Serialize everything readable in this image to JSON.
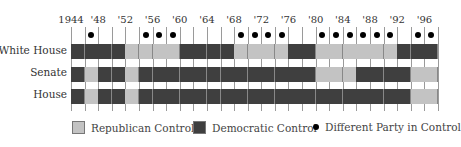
{
  "chart_data": {
    "type": "heatmap",
    "title": "",
    "x_start": 1944,
    "interval_years": 2,
    "years": [
      1944,
      1946,
      1948,
      1950,
      1952,
      1954,
      1956,
      1958,
      1960,
      1962,
      1964,
      1966,
      1968,
      1970,
      1972,
      1974,
      1976,
      1978,
      1980,
      1982,
      1984,
      1986,
      1988,
      1990,
      1992,
      1994,
      1996
    ],
    "tick_labels": [
      {
        "year": 1944,
        "label": "1944"
      },
      {
        "year": 1948,
        "label": "'48"
      },
      {
        "year": 1952,
        "label": "'52"
      },
      {
        "year": 1956,
        "label": "'56"
      },
      {
        "year": 1960,
        "label": "'60"
      },
      {
        "year": 1964,
        "label": "'64"
      },
      {
        "year": 1968,
        "label": "'68"
      },
      {
        "year": 1972,
        "label": "'72"
      },
      {
        "year": 1976,
        "label": "'76"
      },
      {
        "year": 1980,
        "label": "'80"
      },
      {
        "year": 1984,
        "label": "'84"
      },
      {
        "year": 1988,
        "label": "'88"
      },
      {
        "year": 1992,
        "label": "'92"
      },
      {
        "year": 1996,
        "label": "'96"
      }
    ],
    "series": [
      {
        "name": "White House",
        "values": [
          "D",
          "D",
          "D",
          "D",
          "R",
          "R",
          "R",
          "R",
          "D",
          "D",
          "D",
          "D",
          "R",
          "R",
          "R",
          "R",
          "D",
          "D",
          "R",
          "R",
          "R",
          "R",
          "R",
          "R",
          "D",
          "D",
          "D"
        ]
      },
      {
        "name": "Senate",
        "values": [
          "D",
          "R",
          "D",
          "D",
          "R",
          "D",
          "D",
          "D",
          "D",
          "D",
          "D",
          "D",
          "D",
          "D",
          "D",
          "D",
          "D",
          "D",
          "R",
          "R",
          "R",
          "D",
          "D",
          "D",
          "D",
          "R",
          "R"
        ]
      },
      {
        "name": "House",
        "values": [
          "D",
          "R",
          "D",
          "D",
          "R",
          "D",
          "D",
          "D",
          "D",
          "D",
          "D",
          "D",
          "D",
          "D",
          "D",
          "D",
          "D",
          "D",
          "D",
          "D",
          "D",
          "D",
          "D",
          "D",
          "D",
          "R",
          "R"
        ]
      }
    ],
    "divided_government": [
      false,
      true,
      false,
      false,
      false,
      true,
      true,
      true,
      false,
      false,
      false,
      false,
      true,
      true,
      true,
      true,
      false,
      false,
      true,
      true,
      true,
      true,
      true,
      true,
      false,
      true,
      true
    ],
    "legend": [
      {
        "key": "R",
        "label": "Republican Control",
        "color": "#c3c3c3"
      },
      {
        "key": "D",
        "label": "Democratic Control",
        "color": "#3f3f3f"
      },
      {
        "key": "dot",
        "label": "Different Party in Control",
        "color": "#000000"
      }
    ],
    "grid": true,
    "legend_position": "bottom"
  },
  "legend": {
    "republican": "Republican Control",
    "democratic": "Democratic Control",
    "divided": "Different Party in Control"
  },
  "rows": {
    "white_house": "White House",
    "senate": "Senate",
    "house": "House"
  }
}
